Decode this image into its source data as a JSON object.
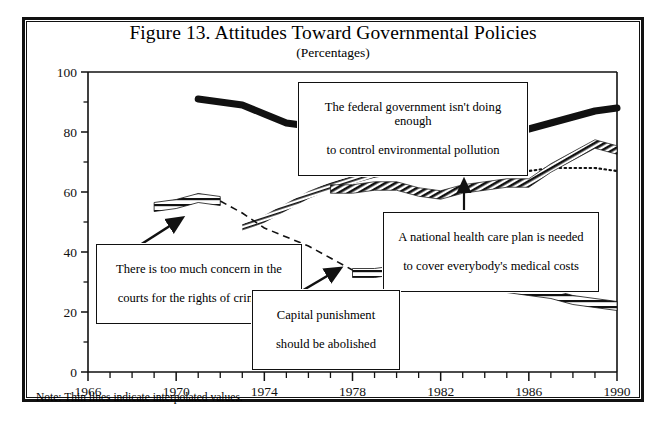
{
  "figure": {
    "title": "Figure 13. Attitudes Toward Governmental Policies",
    "subtitle": "(Percentages)",
    "note": "Note: Thin lines indicate interpolated values."
  },
  "annotations": {
    "environment": {
      "line1": "The federal government isn't doing enough",
      "line2": "to control environmental pollution"
    },
    "healthcare": {
      "line1": "A national health care plan is needed",
      "line2": "to cover everybody's medical costs"
    },
    "criminals": {
      "line1": "There is too much concern in the",
      "line2": "courts for the rights of criminals"
    },
    "capital_punishment": {
      "line1": "Capital punishment",
      "line2": "should be abolished"
    }
  },
  "chart_data": {
    "type": "line",
    "title": "Figure 13. Attitudes Toward Governmental Policies",
    "subtitle": "(Percentages)",
    "note": "Note: Thin lines indicate interpolated values.",
    "xlabel": "",
    "ylabel": "",
    "xlim": [
      1966,
      1990
    ],
    "ylim": [
      0,
      100
    ],
    "grid": false,
    "legend": "none (series labeled by callout boxes)",
    "x_ticks_major": [
      1966,
      1970,
      1974,
      1978,
      1982,
      1986,
      1990
    ],
    "x_ticks_minor_interval": 1,
    "y_ticks_major": [
      0,
      20,
      40,
      60,
      80,
      100
    ],
    "y_ticks_minor": [
      10,
      30,
      50,
      70,
      90
    ],
    "colors": {
      "ink": "#111111",
      "background": "#ffffff"
    },
    "series": [
      {
        "name": "The federal government isn't doing enough to control environmental pollution",
        "short_name": "environment",
        "style": "thick-solid-black",
        "points": [
          {
            "x": 1971,
            "y": 91
          },
          {
            "x": 1972,
            "y": 90
          },
          {
            "x": 1973,
            "y": 89
          },
          {
            "x": 1974,
            "y": 86
          },
          {
            "x": 1975,
            "y": 83
          },
          {
            "x": 1976,
            "y": 82
          },
          {
            "x": 1977,
            "y": 82
          },
          {
            "x": 1978,
            "y": 83
          },
          {
            "x": 1979,
            "y": 82
          },
          {
            "x": 1980,
            "y": 81
          },
          {
            "x": 1981,
            "y": 79
          },
          {
            "x": 1982,
            "y": 78
          },
          {
            "x": 1983,
            "y": 79
          },
          {
            "x": 1984,
            "y": 79
          },
          {
            "x": 1985,
            "y": 79
          },
          {
            "x": 1986,
            "y": 81
          },
          {
            "x": 1987,
            "y": 83
          },
          {
            "x": 1988,
            "y": 85
          },
          {
            "x": 1989,
            "y": 87
          },
          {
            "x": 1990,
            "y": 88
          }
        ]
      },
      {
        "name": "A national health care plan is needed to cover everybody's medical costs",
        "short_name": "healthcare",
        "style": "hatched-dark",
        "points": [
          {
            "x": 1977,
            "y": 61
          },
          {
            "x": 1978,
            "y": 61
          },
          {
            "x": 1979,
            "y": 62
          },
          {
            "x": 1980,
            "y": 62
          },
          {
            "x": 1981,
            "y": 60
          },
          {
            "x": 1982,
            "y": 59
          },
          {
            "x": 1983,
            "y": 61
          },
          {
            "x": 1984,
            "y": 62
          },
          {
            "x": 1985,
            "y": 63
          },
          {
            "x": 1986,
            "y": 63
          },
          {
            "x": 1987,
            "y": 68
          },
          {
            "x": 1988,
            "y": 72
          },
          {
            "x": 1989,
            "y": 76
          },
          {
            "x": 1990,
            "y": 74
          }
        ]
      },
      {
        "name": "Interpolated upper trend (thin/dotted)",
        "short_name": "upper-dotted",
        "style": "hatched-light-then-dotted",
        "points": [
          {
            "x": 1973,
            "y": 48
          },
          {
            "x": 1974,
            "y": 51
          },
          {
            "x": 1975,
            "y": 55
          },
          {
            "x": 1976,
            "y": 59
          },
          {
            "x": 1977,
            "y": 62
          },
          {
            "x": 1978,
            "y": 64
          },
          {
            "x": 1979,
            "y": 66
          },
          {
            "x": 1980,
            "y": 67
          },
          {
            "x": 1981,
            "y": 67
          },
          {
            "x": 1982,
            "y": 67
          },
          {
            "x": 1983,
            "y": 67
          },
          {
            "x": 1984,
            "y": 67
          },
          {
            "x": 1985,
            "y": 67
          },
          {
            "x": 1986,
            "y": 67
          },
          {
            "x": 1987,
            "y": 68
          },
          {
            "x": 1988,
            "y": 68
          },
          {
            "x": 1989,
            "y": 68
          },
          {
            "x": 1990,
            "y": 67
          }
        ]
      },
      {
        "name": "There is too much concern in the courts for the rights of criminals",
        "short_name": "criminals",
        "style": "ladder-hatched-then-dashed",
        "points": [
          {
            "x": 1969,
            "y": 55
          },
          {
            "x": 1970,
            "y": 56
          },
          {
            "x": 1971,
            "y": 58
          },
          {
            "x": 1972,
            "y": 57
          },
          {
            "x": 1973,
            "y": 53
          },
          {
            "x": 1974,
            "y": 48
          },
          {
            "x": 1975,
            "y": 45
          },
          {
            "x": 1976,
            "y": 42
          },
          {
            "x": 1977,
            "y": 38
          },
          {
            "x": 1978,
            "y": 34
          }
        ]
      },
      {
        "name": "Capital punishment should be abolished",
        "short_name": "capital-punishment",
        "style": "ladder-hatched",
        "points": [
          {
            "x": 1978,
            "y": 33
          },
          {
            "x": 1979,
            "y": 33
          },
          {
            "x": 1980,
            "y": 34
          },
          {
            "x": 1981,
            "y": 34
          },
          {
            "x": 1982,
            "y": 31
          },
          {
            "x": 1983,
            "y": 29
          },
          {
            "x": 1984,
            "y": 28
          },
          {
            "x": 1985,
            "y": 28
          },
          {
            "x": 1986,
            "y": 27
          },
          {
            "x": 1987,
            "y": 26
          },
          {
            "x": 1988,
            "y": 24
          },
          {
            "x": 1989,
            "y": 23
          },
          {
            "x": 1990,
            "y": 22
          }
        ]
      }
    ]
  }
}
